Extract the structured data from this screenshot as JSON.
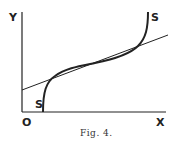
{
  "figure": {
    "caption": "Fig. 4.",
    "labels": {
      "y_axis": "Y",
      "x_axis": "X",
      "origin": "O",
      "curve_start": "S",
      "curve_end": "S"
    },
    "elements": [
      {
        "type": "axes",
        "description": "Y axis vertical, X axis horizontal meeting at origin O"
      },
      {
        "type": "s-curve",
        "description": "Curve S-S starting on X axis, rising steeply, flattening through a point of inflection, then rising steeply again"
      },
      {
        "type": "straight-line",
        "description": "Tangent-like line crossing Y axis above O and intersecting the S curve at three points"
      }
    ]
  }
}
